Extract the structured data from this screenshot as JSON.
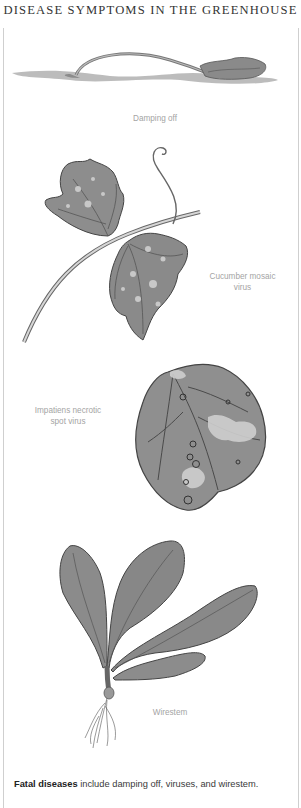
{
  "header": {
    "title": "DISEASE SYMPTOMS IN THE GREENHOUSE"
  },
  "illustrations": [
    {
      "id": "damping-off",
      "label": "Damping off"
    },
    {
      "id": "cucumber-mosaic-virus",
      "label_line1": "Cucumber mosaic",
      "label_line2": "virus"
    },
    {
      "id": "impatiens-necrotic-spot-virus",
      "label_line1": "Impatiens necrotic",
      "label_line2": "spot virus"
    },
    {
      "id": "wirestem",
      "label": "Wirestem"
    }
  ],
  "caption": {
    "bold": "Fatal diseases",
    "text": " include damping off, viruses, and wirestem."
  },
  "colors": {
    "title": "#333333",
    "label": "#a4a4a4",
    "leaf": "#8a8a8a",
    "leaf_dark": "#5a5a5a",
    "border": "#cfcfcf"
  }
}
